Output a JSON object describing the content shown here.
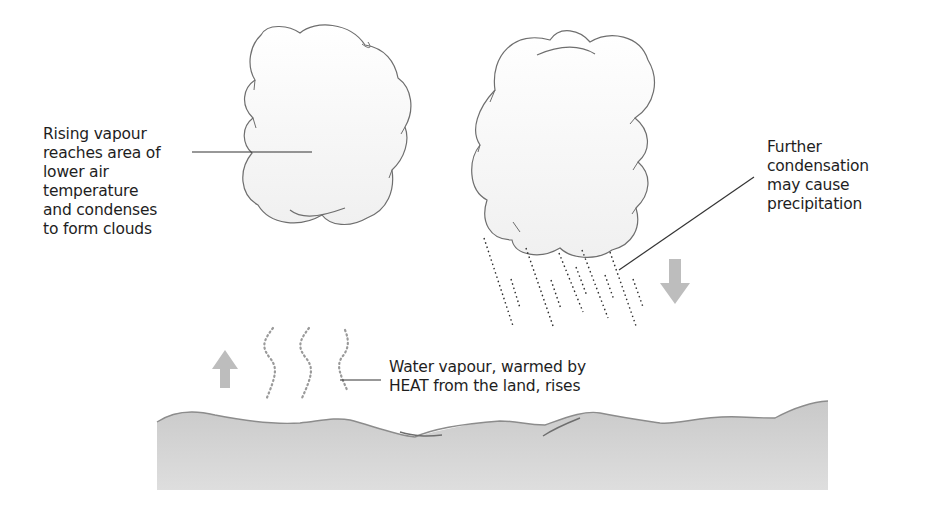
{
  "diagram": {
    "labels": {
      "rising_vapour": "Rising vapour\nreaches area of\nlower air\ntemperature\nand condenses\nto form clouds",
      "further_condensation": "Further\ncondensation\nmay cause\nprecipitation",
      "water_vapour": "Water vapour, warmed by\nHEAT from the land, rises"
    },
    "elements": {
      "cloud_left": "cloud",
      "cloud_right": "rain-cloud",
      "rain": "precipitation-dashes",
      "arrow_up": "arrow-up",
      "arrow_down": "arrow-down",
      "vapour_wisps": "rising-vapour-wisps",
      "land": "land-surface"
    },
    "colors": {
      "cloud_outline": "#6e6e6e",
      "cloud_fill": "#f7f7f7",
      "arrow_fill": "#bdbdbd",
      "land_fill": "#cfcfcf",
      "land_outline": "#8c8c8c",
      "leader_line": "#333333",
      "text": "#1e1e1e"
    }
  }
}
